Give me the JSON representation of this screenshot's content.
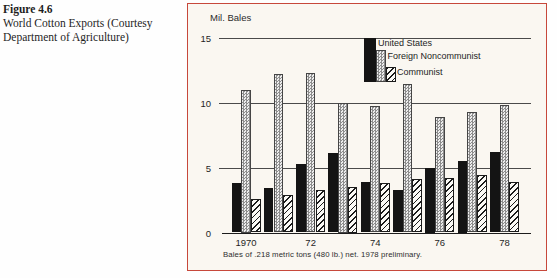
{
  "figure": {
    "label": "Figure 4.6",
    "caption_line1": "World Cotton Exports (Courtesy",
    "caption_line2": "Department of Agriculture)"
  },
  "panel": {
    "border_color": "#c7483b",
    "background_color": "#faf7f1"
  },
  "chart_data": {
    "type": "bar",
    "title": "World Cotton Exports",
    "ylabel": "Mil. Bales",
    "xlabel": "",
    "ylim": [
      0,
      15
    ],
    "yticks": [
      0,
      5,
      10,
      15
    ],
    "grid": "horizontal",
    "legend_position": "top-right-inside",
    "categories": [
      "1970",
      "1971",
      "1972",
      "1973",
      "1974",
      "1975",
      "1976",
      "1977",
      "1978"
    ],
    "x_tick_labels": [
      "1970",
      "72",
      "74",
      "76",
      "78"
    ],
    "x_tick_group_indexes": [
      0,
      2,
      4,
      6,
      8
    ],
    "series": [
      {
        "name": "United States",
        "pattern": "solid-black",
        "values": [
          3.8,
          3.4,
          5.3,
          6.1,
          3.9,
          3.3,
          5.0,
          5.5,
          6.2
        ]
      },
      {
        "name": "Foreign Noncommunist",
        "pattern": "stipple-gray",
        "values": [
          11.0,
          12.2,
          12.3,
          10.0,
          9.7,
          11.4,
          8.9,
          9.3,
          9.8
        ]
      },
      {
        "name": "Communist",
        "pattern": "diagonal-hatch",
        "values": [
          2.6,
          2.9,
          3.3,
          3.5,
          3.8,
          4.1,
          4.2,
          4.4,
          3.9
        ]
      }
    ],
    "footnote": "Bales of .218 metric tons (480 lb.) net. 1978 preliminary."
  }
}
